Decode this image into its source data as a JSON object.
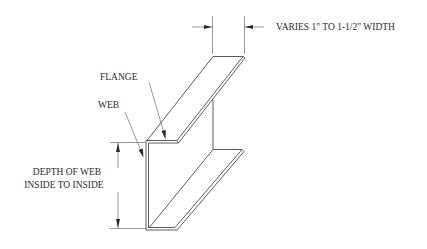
{
  "diagram": {
    "labels": {
      "width_note": "VARIES  1\" TO 1-1/2\" WIDTH",
      "flange": "FLANGE",
      "web": "WEB",
      "depth_line1": "DEPTH OF WEB",
      "depth_line2": "INSIDE TO INSIDE"
    },
    "colors": {
      "line": "#4a4a4a",
      "text": "#2a2a2a",
      "background": "#ffffff"
    },
    "parts": [
      "top-flange",
      "web",
      "bottom-flange"
    ],
    "dimensions": [
      {
        "name": "flange-width",
        "text_key": "width_note"
      },
      {
        "name": "web-depth",
        "text_key": "depth_line1"
      }
    ]
  }
}
